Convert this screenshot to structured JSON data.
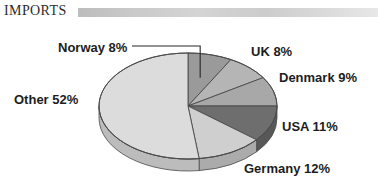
{
  "header": {
    "title": "IMPORTS",
    "rule_color": "#c9c9c9"
  },
  "chart_data": {
    "type": "pie",
    "title": "IMPORTS",
    "xlabel": "",
    "ylabel": "",
    "categories": [
      "Norway",
      "UK",
      "Denmark",
      "USA",
      "Germany",
      "Other"
    ],
    "values": [
      8,
      9,
      9,
      11,
      12,
      52
    ],
    "unit": "%",
    "legend_position": "none",
    "grid": false,
    "three_d": true,
    "start_angle_deg": 0,
    "direction": "clockwise",
    "labels": [
      {
        "key": "norway",
        "text": "Norway 8%",
        "name": "Norway",
        "value": 8,
        "color": "#9a9a9a",
        "leader_line": true
      },
      {
        "key": "uk",
        "text": "UK 8%",
        "name": "UK",
        "value": 8,
        "color": "#b5b5b5",
        "leader_line": false
      },
      {
        "key": "denmark",
        "text": "Denmark 9%",
        "name": "Denmark",
        "value": 9,
        "color": "#a8a8a8",
        "leader_line": false
      },
      {
        "key": "usa",
        "text": "USA 11%",
        "name": "USA",
        "value": 11,
        "color": "#6e6e6e",
        "leader_line": false
      },
      {
        "key": "germany",
        "text": "Germany 12%",
        "name": "Germany",
        "value": 12,
        "color": "#cfcfcf",
        "leader_line": false
      },
      {
        "key": "other",
        "text": "Other 52%",
        "name": "Other",
        "value": 52,
        "color": "#dcdcdc",
        "leader_line": false
      }
    ],
    "slice_colors": {
      "norway": "#9a9a9a",
      "uk": "#b5b5b5",
      "denmark": "#a8a8a8",
      "usa": "#6e6e6e",
      "germany": "#cfcfcf",
      "other": "#dcdcdc"
    },
    "side_colors": {
      "norway": "#7d7d7d",
      "uk": "#949494",
      "denmark": "#8a8a8a",
      "usa": "#585858",
      "germany": "#ababab",
      "other": "#bcbcbc"
    },
    "geometry": {
      "cx": 188,
      "cy": 106,
      "rx": 89,
      "ry": 53,
      "depth": 12,
      "outline_color": "#4a4a4a"
    }
  }
}
